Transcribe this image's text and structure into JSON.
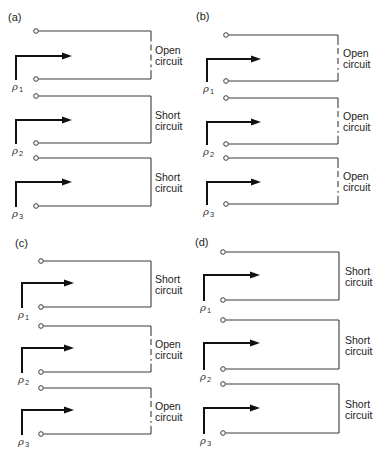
{
  "diagram": {
    "panels": [
      {
        "id": "a",
        "label": "(a)",
        "label_pos": [
          8,
          21
        ],
        "arrow_x": 16,
        "arrow_tip_x": 72,
        "terminal_x": 36,
        "right_x": 151,
        "text_x": 155,
        "ports": [
          {
            "name": "ρ",
            "sub": "1",
            "top_y": 31,
            "bottom_y": 79,
            "arrow_y": 56,
            "termination": "open",
            "text": [
              "Open",
              "circuit"
            ]
          },
          {
            "name": "ρ",
            "sub": "2",
            "top_y": 96,
            "bottom_y": 143,
            "arrow_y": 120,
            "termination": "short",
            "text": [
              "Short",
              "circuit"
            ]
          },
          {
            "name": "ρ",
            "sub": "3",
            "top_y": 158,
            "bottom_y": 206,
            "arrow_y": 182,
            "termination": "short",
            "text": [
              "Short",
              "circuit"
            ]
          }
        ]
      },
      {
        "id": "b",
        "label": "(b)",
        "label_pos": [
          196,
          20
        ],
        "arrow_x": 207,
        "arrow_tip_x": 261,
        "terminal_x": 226,
        "right_x": 338,
        "text_x": 343,
        "ports": [
          {
            "name": "ρ",
            "sub": "1",
            "top_y": 35,
            "bottom_y": 81,
            "arrow_y": 59,
            "termination": "open",
            "text": [
              "Open",
              "circuit"
            ]
          },
          {
            "name": "ρ",
            "sub": "2",
            "top_y": 98,
            "bottom_y": 144,
            "arrow_y": 122,
            "termination": "open",
            "text": [
              "Open",
              "circuit"
            ]
          },
          {
            "name": "ρ",
            "sub": "3",
            "top_y": 158,
            "bottom_y": 204,
            "arrow_y": 182,
            "termination": "open",
            "text": [
              "Open",
              "circuit"
            ]
          }
        ]
      },
      {
        "id": "c",
        "label": "(c)",
        "label_pos": [
          15,
          247
        ],
        "arrow_x": 22,
        "arrow_tip_x": 74,
        "terminal_x": 41,
        "right_x": 151,
        "text_x": 155,
        "ports": [
          {
            "name": "ρ",
            "sub": "1",
            "top_y": 261,
            "bottom_y": 307,
            "arrow_y": 283,
            "termination": "short",
            "text": [
              "Short",
              "circuit"
            ]
          },
          {
            "name": "ρ",
            "sub": "2",
            "top_y": 326,
            "bottom_y": 372,
            "arrow_y": 348,
            "termination": "open",
            "text": [
              "Open",
              "circuit"
            ]
          },
          {
            "name": "ρ",
            "sub": "3",
            "top_y": 388,
            "bottom_y": 434,
            "arrow_y": 410,
            "termination": "open",
            "text": [
              "Open",
              "circuit"
            ]
          }
        ]
      },
      {
        "id": "d",
        "label": "(d)",
        "label_pos": [
          195,
          246
        ],
        "arrow_x": 204,
        "arrow_tip_x": 260,
        "terminal_x": 223,
        "right_x": 339,
        "text_x": 345,
        "ports": [
          {
            "name": "ρ",
            "sub": "1",
            "top_y": 252,
            "bottom_y": 300,
            "arrow_y": 275,
            "termination": "short",
            "text": [
              "Short",
              "circuit"
            ]
          },
          {
            "name": "ρ",
            "sub": "2",
            "top_y": 320,
            "bottom_y": 369,
            "arrow_y": 343,
            "termination": "short",
            "text": [
              "Short",
              "circuit"
            ]
          },
          {
            "name": "ρ",
            "sub": "3",
            "top_y": 384,
            "bottom_y": 433,
            "arrow_y": 408,
            "termination": "short",
            "text": [
              "Short",
              "circuit"
            ]
          }
        ]
      }
    ]
  }
}
